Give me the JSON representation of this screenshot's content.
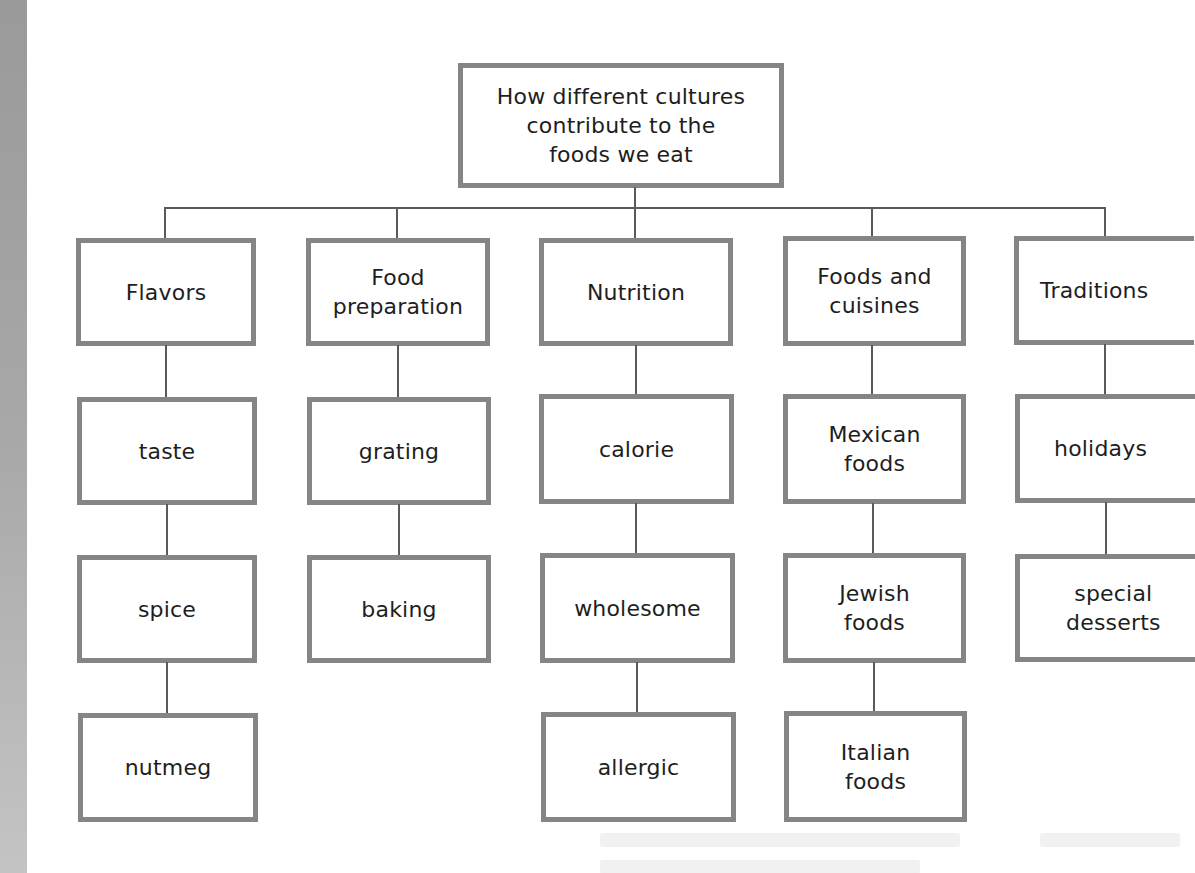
{
  "diagram": {
    "type": "concept-map",
    "root": {
      "label": "How different cultures\ncontribute to the\nfoods we eat"
    },
    "branches": [
      {
        "label": "Flavors",
        "children": [
          "taste",
          "spice",
          "nutmeg"
        ]
      },
      {
        "label": "Food\npreparation",
        "children": [
          "grating",
          "baking"
        ]
      },
      {
        "label": "Nutrition",
        "children": [
          "calorie",
          "wholesome",
          "allergic"
        ]
      },
      {
        "label": "Foods and\ncuisines",
        "children": [
          "Mexican\nfoods",
          "Jewish\nfoods",
          "Italian\nfoods"
        ]
      },
      {
        "label": "Traditions",
        "children": [
          "holidays",
          "special\ndesserts"
        ]
      }
    ]
  },
  "colors": {
    "box_border": "#858585",
    "connector": "#5a5a5a",
    "text": "#1e1e1e",
    "page_spine": "#a8a8a8"
  }
}
